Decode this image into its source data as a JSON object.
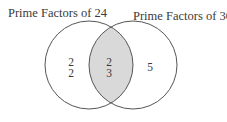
{
  "diagram": {
    "type": "venn",
    "sets": [
      {
        "label": "Prime Factors of 24",
        "only": [
          "2",
          "2"
        ]
      },
      {
        "label": "Prime Factors of 30",
        "only": [
          "5"
        ]
      }
    ],
    "intersection": [
      "2",
      "3"
    ],
    "colors": {
      "stroke": "#555555",
      "intersection_fill": "#d9d9d9",
      "background": "#ffffff"
    }
  }
}
